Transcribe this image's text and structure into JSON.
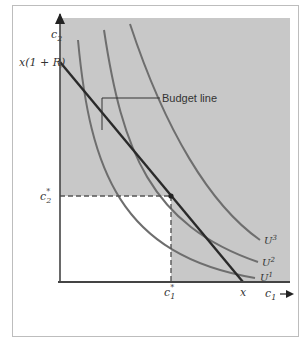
{
  "diagram": {
    "axes": {
      "x_label": "c",
      "x_label_sub": "1",
      "y_label": "c",
      "y_label_sub": "2"
    },
    "labels": {
      "y_intercept": "x(1 + R)",
      "x_intercept": "x",
      "budget_line": "Budget line",
      "c2_star": "c",
      "c2_star_sub": "2",
      "c2_star_sup": "*",
      "c1_star": "c",
      "c1_star_sub": "1",
      "c1_star_sup": "*"
    },
    "indifference_curves": [
      {
        "name": "U",
        "sup": "1"
      },
      {
        "name": "U",
        "sup": "2"
      },
      {
        "name": "U",
        "sup": "3"
      }
    ],
    "colors": {
      "shade": "#c8c8c8",
      "curve": "#6e6e6e",
      "budget": "#2a2a2a",
      "axis": "#444444"
    }
  }
}
